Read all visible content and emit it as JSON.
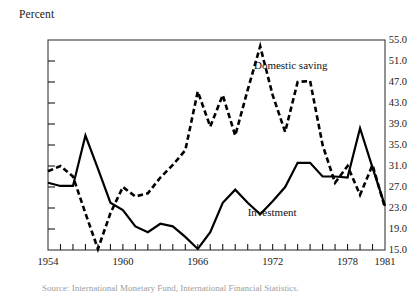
{
  "figure": {
    "y_axis_title": "Percent",
    "series_labels": {
      "saving": "Domestic saving",
      "investment": "Investment"
    },
    "source_note": "Source: International Monetary Fund, International Financial Statistics."
  },
  "chart_data": {
    "type": "line",
    "title": "",
    "subtitle": "",
    "xlabel": "",
    "ylabel": "Percent",
    "ylim": [
      15.0,
      55.0
    ],
    "xlim": [
      1954,
      1981
    ],
    "grid": false,
    "legend_position": "inline-annotation",
    "ytick_labels": [
      "55.0",
      "51.0",
      "47.0",
      "43.0",
      "39.0",
      "35.0",
      "31.0",
      "27.0",
      "23.0",
      "19.0",
      "15.0"
    ],
    "ytick_values": [
      55.0,
      51.0,
      47.0,
      43.0,
      39.0,
      35.0,
      31.0,
      27.0,
      23.0,
      19.0,
      15.0
    ],
    "xtick_labels": [
      "1954",
      "1960",
      "1966",
      "1972",
      "1978",
      "1981"
    ],
    "xtick_values": [
      1954,
      1960,
      1966,
      1972,
      1978,
      1981
    ],
    "x": [
      1954,
      1955,
      1956,
      1957,
      1958,
      1959,
      1960,
      1961,
      1962,
      1963,
      1964,
      1965,
      1966,
      1967,
      1968,
      1969,
      1970,
      1971,
      1972,
      1973,
      1974,
      1975,
      1976,
      1977,
      1978,
      1979,
      1980,
      1981
    ],
    "series": [
      {
        "name": "Investment",
        "style": "solid",
        "color": "#000000",
        "values": [
          27.8,
          27.2,
          27.2,
          36.8,
          30.5,
          24.0,
          22.6,
          19.5,
          18.4,
          20.0,
          19.5,
          17.5,
          15.2,
          18.4,
          24.0,
          26.5,
          24.0,
          21.8,
          24.3,
          27.0,
          31.6,
          31.6,
          29.0,
          29.0,
          28.8,
          38.2,
          30.7,
          23.4
        ]
      },
      {
        "name": "Domestic saving",
        "style": "dashed",
        "color": "#000000",
        "values": [
          30.0,
          31.0,
          29.0,
          22.0,
          15.2,
          22.0,
          27.0,
          25.2,
          25.8,
          28.8,
          31.2,
          34.0,
          45.2,
          38.5,
          44.5,
          36.8,
          45.5,
          53.8,
          44.5,
          37.5,
          47.0,
          47.2,
          35.0,
          27.8,
          31.0,
          25.5,
          31.2,
          23.0
        ]
      }
    ],
    "annotations": [
      {
        "text": "Domestic saving",
        "x": 1970.5,
        "y": 50.0
      },
      {
        "text": "Investment",
        "x": 1970.0,
        "y": 22.0
      }
    ]
  }
}
